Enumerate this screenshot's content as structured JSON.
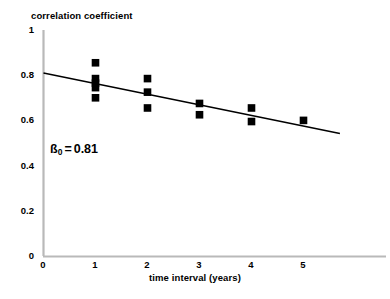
{
  "chart_data": {
    "type": "scatter",
    "title": "",
    "xlabel": "time interval (years)",
    "ylabel": "correlation coefficient",
    "xlim": [
      0,
      5.7
    ],
    "ylim": [
      0,
      1
    ],
    "xticks": [
      "0",
      "1",
      "2",
      "3",
      "4",
      "5"
    ],
    "xtick_values": [
      0,
      1,
      2,
      3,
      4,
      5
    ],
    "yticks": [
      "0",
      "0.2",
      "0.4",
      "0.6",
      "0.8",
      "1"
    ],
    "ytick_values": [
      0,
      0.2,
      0.4,
      0.6,
      0.8,
      1
    ],
    "grid": false,
    "legend": null,
    "marker": "square",
    "marker_color": "#000000",
    "axis_color": "#b4b4b4",
    "background_color": "#ffffff",
    "x": [
      1,
      1,
      1,
      1,
      1,
      2,
      2,
      2,
      3,
      3,
      4,
      4,
      5
    ],
    "y": [
      0.855,
      0.785,
      0.765,
      0.745,
      0.7,
      0.785,
      0.725,
      0.655,
      0.675,
      0.625,
      0.655,
      0.595,
      0.6
    ],
    "points": [
      {
        "x": 1,
        "y": 0.855
      },
      {
        "x": 1,
        "y": 0.785
      },
      {
        "x": 1,
        "y": 0.765
      },
      {
        "x": 1,
        "y": 0.745
      },
      {
        "x": 1,
        "y": 0.7
      },
      {
        "x": 2,
        "y": 0.785
      },
      {
        "x": 2,
        "y": 0.725
      },
      {
        "x": 2,
        "y": 0.655
      },
      {
        "x": 3,
        "y": 0.675
      },
      {
        "x": 3,
        "y": 0.625
      },
      {
        "x": 4,
        "y": 0.655
      },
      {
        "x": 4,
        "y": 0.595
      },
      {
        "x": 5,
        "y": 0.6
      }
    ],
    "trendline": {
      "type": "linear",
      "intercept": 0.81,
      "slope": -0.047,
      "x_start": 0,
      "x_end": 5.7,
      "y_start": 0.81,
      "y_end": 0.542,
      "color": "#000000"
    },
    "annotations": [
      {
        "symbol": "ß",
        "subscript": "0",
        "equals": "=",
        "value": "0.81",
        "x": 0.55,
        "y": 0.43
      }
    ]
  },
  "axes": {
    "y_title": "correlation coefficient",
    "x_title": "time interval (years)"
  },
  "ytick_labels": [
    "1",
    "0.8",
    "0.6",
    "0.4",
    "0.2",
    "0"
  ],
  "xtick_labels": [
    "0",
    "1",
    "2",
    "3",
    "4",
    "5"
  ],
  "annotation": {
    "symbol": "ß",
    "subscript": "0",
    "equals": "=",
    "value": "0.81"
  }
}
